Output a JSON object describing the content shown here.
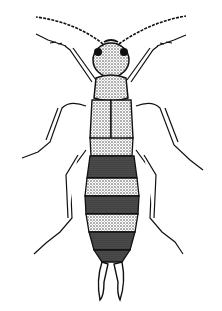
{
  "image": {
    "subject": "Earwig",
    "description": "Black and white pen illustration of an earwig, dorsal view",
    "colors": {
      "ink": "#111111",
      "paper": "#ffffff",
      "shade": "#555555"
    }
  }
}
